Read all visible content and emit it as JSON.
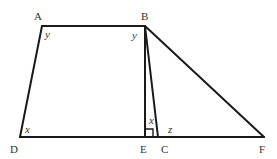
{
  "diagram": {
    "colors": {
      "stroke": "#1a1a1a",
      "text": "#333333",
      "background": "#ffffff"
    },
    "points": {
      "A": {
        "label": "A",
        "x": 42,
        "y": 26
      },
      "B": {
        "label": "B",
        "x": 145,
        "y": 26
      },
      "D": {
        "label": "D",
        "x": 20,
        "y": 137
      },
      "E": {
        "label": "E",
        "x": 145,
        "y": 137
      },
      "C": {
        "label": "C",
        "x": 158,
        "y": 137
      },
      "F": {
        "label": "F",
        "x": 264,
        "y": 137
      }
    },
    "segments": [
      "AB",
      "AD",
      "DF",
      "BE",
      "BC",
      "BF"
    ],
    "right_angle_at": "E",
    "angle_labels": {
      "A": "y",
      "B": "y",
      "D": "x",
      "E": "x",
      "C": "z"
    }
  }
}
